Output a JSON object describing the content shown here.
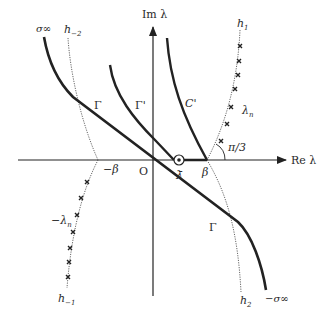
{
  "diagram": {
    "axes": {
      "im_label": "Im λ",
      "re_label": "Re λ",
      "origin_label": "O"
    },
    "curves": {
      "gamma": {
        "label": "Γ",
        "label2": "Γ",
        "start_label": "σ∞",
        "end_label": "−σ∞"
      },
      "gamma_prime": {
        "label": "Γ'"
      },
      "c_prime": {
        "label": "C'"
      }
    },
    "hyperbola_branches": {
      "h1": {
        "base": "h",
        "sub": "1"
      },
      "h_minus_2": {
        "base": "h",
        "sub": "−2"
      },
      "h_minus_1": {
        "base": "h",
        "sub": "−1"
      },
      "h2": {
        "base": "h",
        "sub": "2"
      }
    },
    "points": {
      "beta": "β",
      "minus_beta": "−β",
      "lambda_bar": "λ̄",
      "lambda_n": {
        "base": "λ",
        "sub": "n"
      },
      "minus_lambda_n": {
        "base": "−λ",
        "sub": "n"
      }
    },
    "angle_label": "π/3",
    "colors": {
      "ink": "#222222",
      "dotted": "#555555"
    }
  }
}
